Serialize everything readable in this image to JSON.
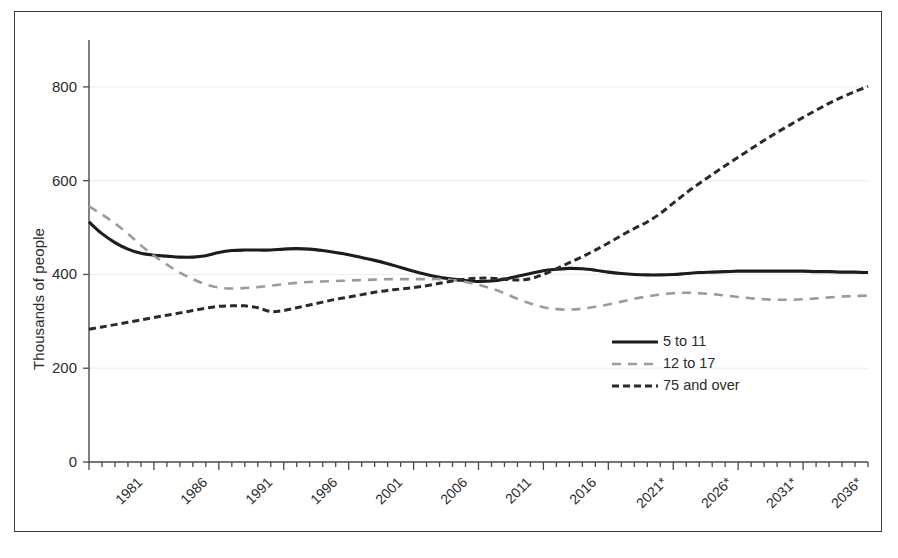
{
  "chart_data": {
    "type": "line",
    "title": "",
    "xlabel": "",
    "ylabel": "Thousands of people",
    "ylim": [
      0,
      900
    ],
    "yticks": [
      0,
      200,
      400,
      600,
      800
    ],
    "ytick_labels": [
      "0",
      "200",
      "400",
      "600",
      "800"
    ],
    "xlim": [
      1981,
      2041
    ],
    "xticks": [
      1981,
      1986,
      1991,
      1996,
      2001,
      2006,
      2011,
      2016,
      2021,
      2026,
      2031,
      2036
    ],
    "xtick_labels": [
      "1981",
      "1986",
      "1991",
      "1996",
      "2001",
      "2006",
      "2011",
      "2016",
      "2021*",
      "2026*",
      "2031*",
      "2036*"
    ],
    "minor_xtick_interval": 1,
    "grid": "horizontal-faint",
    "legend_position": "center-right-inside",
    "x": [
      1981,
      1982,
      1983,
      1984,
      1985,
      1986,
      1987,
      1988,
      1989,
      1990,
      1991,
      1992,
      1993,
      1994,
      1995,
      1996,
      1997,
      1998,
      1999,
      2000,
      2001,
      2002,
      2003,
      2004,
      2005,
      2006,
      2007,
      2008,
      2009,
      2010,
      2011,
      2012,
      2013,
      2014,
      2015,
      2016,
      2017,
      2018,
      2019,
      2020,
      2021,
      2022,
      2023,
      2024,
      2025,
      2026,
      2027,
      2028,
      2029,
      2030,
      2031,
      2032,
      2033,
      2034,
      2035,
      2036,
      2037,
      2038,
      2039,
      2040,
      2041
    ],
    "series": [
      {
        "name": "5 to 11",
        "style": "solid",
        "color": "#1c1c1c",
        "width": 3.1,
        "values": [
          512,
          487,
          468,
          454,
          445,
          441,
          439,
          437,
          437,
          440,
          447,
          451,
          452,
          452,
          452,
          454,
          455,
          454,
          451,
          447,
          442,
          436,
          430,
          423,
          415,
          407,
          400,
          394,
          390,
          387,
          385,
          386,
          390,
          396,
          402,
          408,
          411,
          413,
          412,
          409,
          405,
          402,
          400,
          399,
          399,
          400,
          402,
          404,
          405,
          406,
          407,
          407,
          407,
          407,
          407,
          407,
          406,
          406,
          405,
          405,
          404
        ]
      },
      {
        "name": "12 to 17",
        "style": "dashed-long",
        "color": "#9b9b9b",
        "width": 2.6,
        "values": [
          545,
          528,
          509,
          487,
          462,
          440,
          421,
          404,
          390,
          379,
          372,
          370,
          371,
          373,
          376,
          379,
          382,
          384,
          385,
          386,
          387,
          388,
          389,
          390,
          390,
          390,
          390,
          390,
          388,
          384,
          378,
          370,
          360,
          348,
          338,
          330,
          326,
          325,
          327,
          331,
          336,
          342,
          348,
          353,
          357,
          360,
          361,
          360,
          358,
          355,
          352,
          349,
          347,
          346,
          346,
          347,
          349,
          351,
          353,
          354,
          355
        ]
      },
      {
        "name": "75 and over",
        "style": "dashed-short",
        "color": "#2a2a2a",
        "width": 3.0,
        "values": [
          283,
          288,
          293,
          298,
          303,
          308,
          313,
          318,
          323,
          328,
          332,
          333,
          333,
          329,
          321,
          323,
          329,
          335,
          341,
          347,
          352,
          357,
          362,
          366,
          369,
          372,
          376,
          381,
          386,
          390,
          392,
          392,
          390,
          388,
          391,
          400,
          412,
          425,
          438,
          452,
          467,
          483,
          498,
          512,
          530,
          552,
          574,
          594,
          613,
          632,
          650,
          668,
          686,
          703,
          719,
          735,
          750,
          765,
          778,
          790,
          801
        ]
      }
    ]
  },
  "legend": {
    "items": [
      {
        "label": "5 to 11"
      },
      {
        "label": "12 to 17"
      },
      {
        "label": "75 and over"
      }
    ]
  }
}
